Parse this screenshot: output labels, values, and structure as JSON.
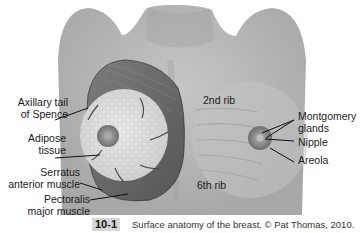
{
  "figure": {
    "number": "10-1",
    "caption": "Surface anatomy of the breast. © Pat Thomas, 2010."
  },
  "labels": {
    "left": [
      {
        "id": "axillary-tail",
        "line1": "Axillary tail",
        "line2": "of Spence"
      },
      {
        "id": "adipose-tissue",
        "line1": "Adipose",
        "line2": "tissue"
      },
      {
        "id": "serratus-anterior",
        "line1": "Serratus",
        "line2": "anterior muscle"
      },
      {
        "id": "pectoralis-major",
        "line1": "Pectoralis",
        "line2": "major muscle"
      }
    ],
    "center": [
      {
        "id": "2nd-rib",
        "text": "2nd rib"
      },
      {
        "id": "6th-rib",
        "text": "6th rib"
      }
    ],
    "right": [
      {
        "id": "montgomery-glands",
        "line1": "Montgomery",
        "line2": "glands"
      },
      {
        "id": "nipple",
        "text": "Nipple"
      },
      {
        "id": "areola",
        "text": "Areola"
      }
    ]
  },
  "colors": {
    "skin": "#b4b4b4",
    "skin_light": "#c8c8c8",
    "muscle": "#6e6e6e",
    "adipose": "#dedede",
    "areola": "#8a8a8a",
    "leader_line": "#111111"
  }
}
